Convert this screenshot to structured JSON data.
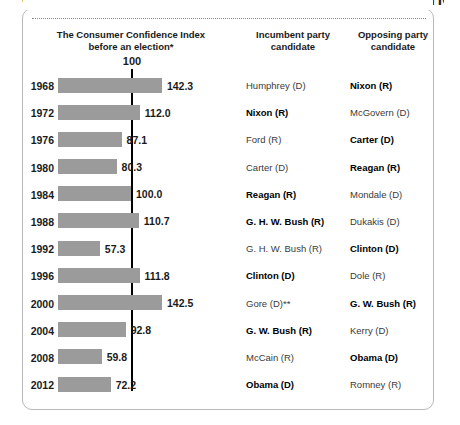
{
  "headline": "CONSUMER CONFIDENCE AND PRESIDENTIAL ELECTIONS",
  "headers": {
    "chart": "The Consumer Confidence Index before an election*",
    "incumbent": "Incumbent party candidate",
    "opposing": "Opposing party candidate"
  },
  "axis": {
    "reference_label": "100"
  },
  "colors": {
    "bar": "#9b9b9b",
    "reference_line": "#000000",
    "text": "#1a1a1a",
    "panel_border": "#b9b9b9"
  },
  "chart_data": {
    "type": "bar",
    "title": "CONSUMER CONFIDENCE AND PRESIDENTIAL ELECTIONS",
    "xlabel": "",
    "ylabel": "",
    "orientation": "horizontal",
    "xlim": [
      0,
      150
    ],
    "grid": false,
    "reference_line": 100,
    "categories": [
      "1968",
      "1972",
      "1976",
      "1980",
      "1984",
      "1988",
      "1992",
      "1996",
      "2000",
      "2004",
      "2008",
      "2012"
    ],
    "values": [
      142.3,
      112.0,
      87.1,
      80.3,
      100.0,
      110.7,
      57.3,
      111.8,
      142.5,
      92.8,
      59.8,
      72.2
    ],
    "rows": [
      {
        "year": "1968",
        "value": "142.3",
        "number": 142.3,
        "incumbent": "Humphrey (D)",
        "incumbent_won": false,
        "opposing": "Nixon (R)",
        "opposing_won": true
      },
      {
        "year": "1972",
        "value": "112.0",
        "number": 112.0,
        "incumbent": "Nixon (R)",
        "incumbent_won": true,
        "opposing": "McGovern (D)",
        "opposing_won": false
      },
      {
        "year": "1976",
        "value": "87.1",
        "number": 87.1,
        "incumbent": "Ford (R)",
        "incumbent_won": false,
        "opposing": "Carter (D)",
        "opposing_won": true
      },
      {
        "year": "1980",
        "value": "80.3",
        "number": 80.3,
        "incumbent": "Carter (D)",
        "incumbent_won": false,
        "opposing": "Reagan (R)",
        "opposing_won": true
      },
      {
        "year": "1984",
        "value": "100.0",
        "number": 100.0,
        "incumbent": "Reagan (R)",
        "incumbent_won": true,
        "opposing": "Mondale (D)",
        "opposing_won": false
      },
      {
        "year": "1988",
        "value": "110.7",
        "number": 110.7,
        "incumbent": "G. H. W. Bush (R)",
        "incumbent_won": true,
        "opposing": "Dukakis (D)",
        "opposing_won": false
      },
      {
        "year": "1992",
        "value": "57.3",
        "number": 57.3,
        "incumbent": "G. H. W. Bush (R)",
        "incumbent_won": false,
        "opposing": "Clinton (D)",
        "opposing_won": true
      },
      {
        "year": "1996",
        "value": "111.8",
        "number": 111.8,
        "incumbent": "Clinton (D)",
        "incumbent_won": true,
        "opposing": "Dole (R)",
        "opposing_won": false
      },
      {
        "year": "2000",
        "value": "142.5",
        "number": 142.5,
        "incumbent": "Gore (D)**",
        "incumbent_won": false,
        "opposing": "G. W. Bush (R)",
        "opposing_won": true
      },
      {
        "year": "2004",
        "value": "92.8",
        "number": 92.8,
        "incumbent": "G. W. Bush (R)",
        "incumbent_won": true,
        "opposing": "Kerry (D)",
        "opposing_won": false
      },
      {
        "year": "2008",
        "value": "59.8",
        "number": 59.8,
        "incumbent": "McCain (R)",
        "incumbent_won": false,
        "opposing": "Obama (D)",
        "opposing_won": true
      },
      {
        "year": "2012",
        "value": "72.2",
        "number": 72.2,
        "incumbent": "Obama (D)",
        "incumbent_won": true,
        "opposing": "Romney (R)",
        "opposing_won": false
      }
    ]
  }
}
